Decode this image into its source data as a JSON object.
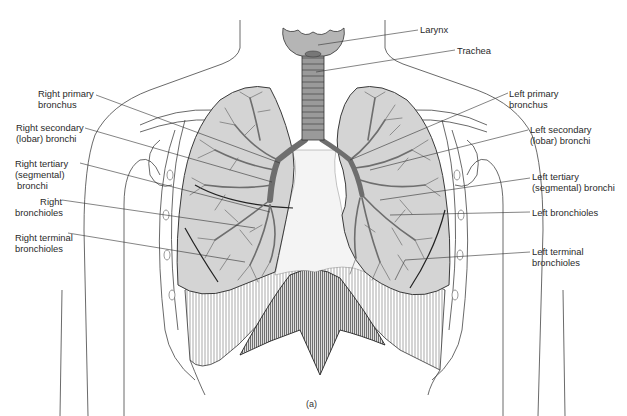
{
  "figure": {
    "caption": "(a)",
    "colors": {
      "lung_fill": "#d4d4d4",
      "bronchi": "#6e6e6e",
      "outline": "#3a3a3a",
      "trachea": "#9a9a9a",
      "text": "#2a2a2a"
    }
  },
  "labels": {
    "larynx": {
      "lines": [
        "Larynx"
      ]
    },
    "trachea": {
      "lines": [
        "Trachea"
      ]
    },
    "right_primary_bronchus": {
      "lines": [
        "Right primary",
        "bronchus"
      ]
    },
    "right_secondary_bronchi": {
      "lines": [
        "Right secondary",
        "(lobar) bronchi"
      ]
    },
    "right_tertiary_bronchi": {
      "lines": [
        "Right tertiary",
        "(segmental)",
        "bronchi"
      ]
    },
    "right_bronchioles": {
      "lines": [
        "Right",
        "bronchioles"
      ]
    },
    "right_terminal_bronchioles": {
      "lines": [
        "Right terminal",
        "bronchioles"
      ]
    },
    "left_primary_bronchus": {
      "lines": [
        "Left primary",
        "bronchus"
      ]
    },
    "left_secondary_bronchi": {
      "lines": [
        "Left secondary",
        "(lobar) bronchi"
      ]
    },
    "left_tertiary_bronchi": {
      "lines": [
        "Left tertiary",
        "(segmental) bronchi"
      ]
    },
    "left_bronchioles": {
      "lines": [
        "Left bronchioles"
      ]
    },
    "left_terminal_bronchioles": {
      "lines": [
        "Left terminal",
        "bronchioles"
      ]
    }
  }
}
